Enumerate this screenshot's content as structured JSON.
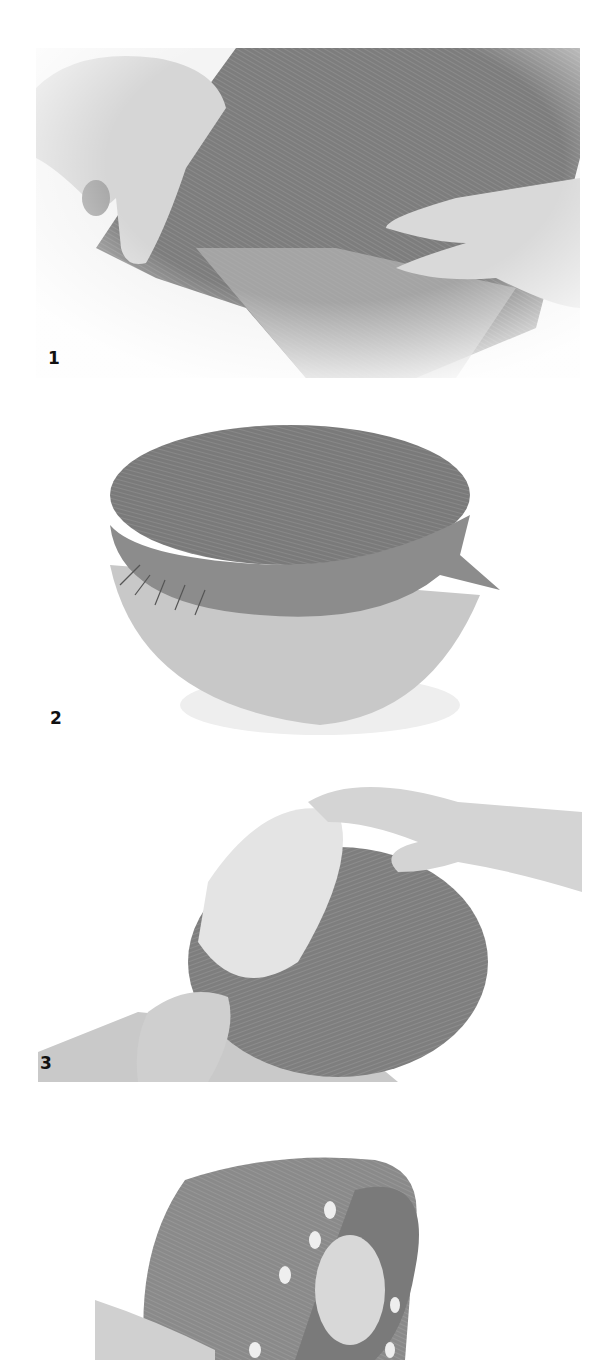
{
  "figure": {
    "steps": [
      {
        "number": "1",
        "description": "Hands stretching sinamay fabric over a hat block"
      },
      {
        "number": "2",
        "description": "Sinamay pinned around the crown of the hat block"
      },
      {
        "number": "3",
        "description": "Hands smoothing fabric over the block, shown from the side"
      },
      {
        "number": "4",
        "description": "Blocked sinamay crown with pins around the edge"
      }
    ]
  }
}
